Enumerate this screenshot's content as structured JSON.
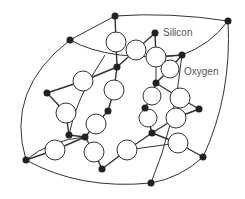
{
  "diagram": {
    "labels": {
      "silicon": "Silicon",
      "oxygen": "Oxygen"
    },
    "colors": {
      "silicon_fill": "#222222",
      "oxygen_fill": "#ffffff",
      "stroke": "#333333",
      "label": "#555555"
    },
    "silicon_atoms": [
      {
        "id": "si1",
        "x": 115,
        "y": 16
      },
      {
        "id": "si2",
        "x": 228,
        "y": 21
      },
      {
        "id": "si3",
        "x": 70,
        "y": 40
      },
      {
        "id": "si4",
        "x": 155,
        "y": 33
      },
      {
        "id": "si5",
        "x": 182,
        "y": 55
      },
      {
        "id": "si6",
        "x": 117,
        "y": 67
      },
      {
        "id": "si7",
        "x": 156,
        "y": 83
      },
      {
        "id": "si8",
        "x": 47,
        "y": 93
      },
      {
        "id": "si9",
        "x": 145,
        "y": 108
      },
      {
        "id": "si10",
        "x": 199,
        "y": 109
      },
      {
        "id": "si11",
        "x": 108,
        "y": 111
      },
      {
        "id": "si12",
        "x": 152,
        "y": 133
      },
      {
        "id": "si13",
        "x": 69,
        "y": 135
      },
      {
        "id": "si14",
        "x": 85,
        "y": 137
      },
      {
        "id": "si15",
        "x": 26,
        "y": 160
      },
      {
        "id": "si16",
        "x": 203,
        "y": 157
      },
      {
        "id": "si17",
        "x": 102,
        "y": 169
      },
      {
        "id": "si18",
        "x": 151,
        "y": 183
      }
    ],
    "oxygen_atoms": [
      {
        "id": "o1",
        "x": 116,
        "y": 42
      },
      {
        "id": "o2",
        "x": 136,
        "y": 50
      },
      {
        "id": "o3",
        "x": 156,
        "y": 57
      },
      {
        "id": "o4",
        "x": 170,
        "y": 69
      },
      {
        "id": "o5",
        "x": 83,
        "y": 81
      },
      {
        "id": "o6",
        "x": 114,
        "y": 90
      },
      {
        "id": "o7",
        "x": 152,
        "y": 96
      },
      {
        "id": "o8",
        "x": 180,
        "y": 98
      },
      {
        "id": "o9",
        "x": 66,
        "y": 113
      },
      {
        "id": "o10",
        "x": 148,
        "y": 118
      },
      {
        "id": "o11",
        "x": 176,
        "y": 118
      },
      {
        "id": "o12",
        "x": 96,
        "y": 124
      },
      {
        "id": "o13",
        "x": 178,
        "y": 143
      },
      {
        "id": "o14",
        "x": 55,
        "y": 150
      },
      {
        "id": "o15",
        "x": 94,
        "y": 152
      },
      {
        "id": "o16",
        "x": 127,
        "y": 150
      }
    ]
  }
}
